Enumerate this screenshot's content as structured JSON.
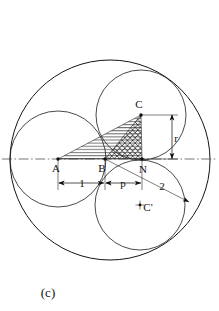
{
  "figure": {
    "caption": "(c)",
    "points": [
      {
        "id": "A",
        "label": "A",
        "x": 58,
        "y": 159,
        "label_x": 56,
        "label_y": 172
      },
      {
        "id": "B",
        "label": "B",
        "x": 105,
        "y": 159,
        "label_x": 100,
        "label_y": 172
      },
      {
        "id": "N",
        "label": "N",
        "x": 142,
        "y": 159,
        "label_x": 140,
        "label_y": 173
      },
      {
        "id": "C",
        "label": "C",
        "x": 141,
        "y": 115,
        "label_x": 137,
        "label_y": 108
      },
      {
        "id": "Cp",
        "label": "C'",
        "x": 140,
        "y": 205,
        "label_x": 144,
        "label_y": 211
      }
    ],
    "dimensions": [
      {
        "id": "len1",
        "label": "1",
        "from_x": 58,
        "to_x": 105,
        "y": 183,
        "label_x": 82,
        "label_y": 187
      },
      {
        "id": "lenp",
        "label": "p",
        "from_x": 105,
        "to_x": 142,
        "y": 183,
        "label_x": 123,
        "label_y": 187
      },
      {
        "id": "lenr",
        "label": "r",
        "x": 172,
        "from_y": 115,
        "to_y": 159,
        "label_x": 174,
        "label_y": 141
      },
      {
        "id": "len2",
        "label": "2",
        "label_x": 160,
        "label_y": 190
      }
    ],
    "circles": [
      {
        "id": "outer-circle",
        "cx": 110,
        "cy": 160,
        "r": 100
      },
      {
        "id": "left-circle",
        "cx": 58,
        "cy": 159,
        "r": 48
      },
      {
        "id": "upper-circle",
        "cx": 141,
        "cy": 115,
        "r": 45
      },
      {
        "id": "lower-circle",
        "cx": 140,
        "cy": 205,
        "r": 45
      }
    ],
    "hatched_regions": [
      {
        "id": "triangle-ACN",
        "pattern": "horizontal",
        "points": "58,159 141,115 142,159"
      },
      {
        "id": "triangle-BCN",
        "pattern": "cross",
        "points": "105,159 141,115 142,159"
      }
    ],
    "axis": {
      "id": "horizontal-axis",
      "y": 159,
      "x1": 2,
      "x2": 217
    },
    "colors": {
      "ink": "#111111",
      "line": "#1a1a1a",
      "axis": "#3a3a3a",
      "background": "#ffffff"
    }
  }
}
